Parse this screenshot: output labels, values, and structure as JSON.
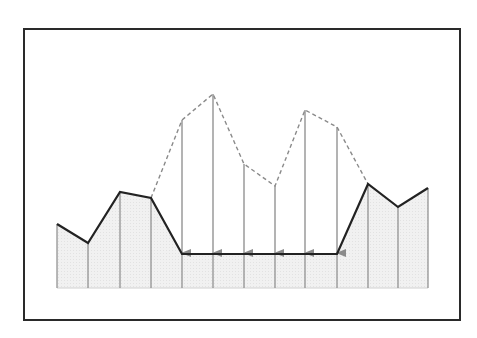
{
  "diagram": {
    "type": "terrain-profile-with-lowering-arrows",
    "colors": {
      "background": "#ffffff",
      "frame": "#2a2a2a",
      "fill": "#eeeeee",
      "column_lines": "#8a8a8a",
      "profile_line": "#222222",
      "dashed_line": "#8a8a8a",
      "arrows": "#8a8a8a"
    },
    "frame": {
      "x": 24,
      "y": 29,
      "width": 436,
      "height": 291
    },
    "baseline_y": 288,
    "flat_level_y": 254,
    "columns_x": [
      57,
      88,
      120,
      151,
      182,
      213,
      244,
      275,
      305,
      337,
      368,
      398,
      428
    ],
    "profile_points": [
      {
        "x": 57,
        "y": 224
      },
      {
        "x": 88,
        "y": 243
      },
      {
        "x": 120,
        "y": 192
      },
      {
        "x": 151,
        "y": 198
      },
      {
        "x": 182,
        "y": 254
      },
      {
        "x": 213,
        "y": 254
      },
      {
        "x": 244,
        "y": 254
      },
      {
        "x": 275,
        "y": 254
      },
      {
        "x": 305,
        "y": 254
      },
      {
        "x": 337,
        "y": 254
      },
      {
        "x": 368,
        "y": 184
      },
      {
        "x": 398,
        "y": 207
      },
      {
        "x": 428,
        "y": 188
      }
    ],
    "original_dashed_points": [
      {
        "x": 151,
        "y": 198
      },
      {
        "x": 182,
        "y": 120
      },
      {
        "x": 213,
        "y": 94
      },
      {
        "x": 244,
        "y": 164
      },
      {
        "x": 275,
        "y": 186
      },
      {
        "x": 305,
        "y": 110
      },
      {
        "x": 337,
        "y": 127
      },
      {
        "x": 368,
        "y": 184
      }
    ],
    "arrows": [
      {
        "x": 182,
        "from_y": 120,
        "to_y": 253
      },
      {
        "x": 213,
        "from_y": 94,
        "to_y": 253
      },
      {
        "x": 244,
        "from_y": 164,
        "to_y": 253
      },
      {
        "x": 275,
        "from_y": 186,
        "to_y": 253
      },
      {
        "x": 305,
        "from_y": 110,
        "to_y": 253
      },
      {
        "x": 337,
        "from_y": 127,
        "to_y": 253
      }
    ]
  }
}
